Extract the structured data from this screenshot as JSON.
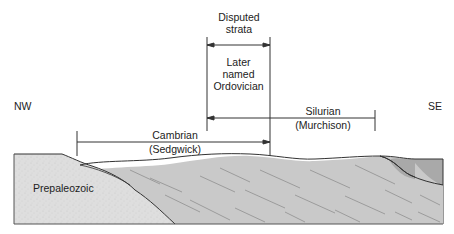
{
  "diagram": {
    "orientation": {
      "left": "NW",
      "right": "SE"
    },
    "labels": {
      "disputed": [
        "Disputed",
        "strata"
      ],
      "ordovician": [
        "Later",
        "named",
        "Ordovician"
      ],
      "silurian": [
        "Silurian",
        "(Murchison)"
      ],
      "cambrian": [
        "Cambrian",
        "(Sedgwick)"
      ],
      "prepaleozoic": "Prepaleozoic"
    },
    "ranges": [
      {
        "name": "Disputed strata",
        "from_x": 207,
        "to_x": 270,
        "y": 45
      },
      {
        "name": "Silurian (Murchison)",
        "from_x": 375,
        "to_x": 207,
        "y": 118
      },
      {
        "name": "Cambrian (Sedgwick)",
        "from_x": 77,
        "to_x": 270,
        "y": 142
      }
    ],
    "colors": {
      "prepaleozoic_fill": "#dcdcdc",
      "strata_fill": "#c8c8c8",
      "upper_se_fill": "#ababab",
      "line": "#333333",
      "hatch": "#8a8a8a"
    }
  }
}
